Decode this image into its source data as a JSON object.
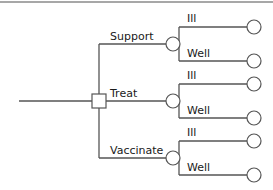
{
  "diagram": {
    "type": "decision-tree",
    "colors": {
      "line": "#555555",
      "rule": "#8a8a8a",
      "text": "#1a1a1a",
      "background": "#ffffff"
    },
    "root": {
      "node_type": "decision",
      "shape": "square"
    },
    "options": [
      {
        "label": "Support",
        "node_type": "chance",
        "outcomes": [
          {
            "label": "Ill",
            "node_type": "terminal"
          },
          {
            "label": "Well",
            "node_type": "terminal"
          }
        ]
      },
      {
        "label": "Treat",
        "node_type": "chance",
        "outcomes": [
          {
            "label": "Ill",
            "node_type": "terminal"
          },
          {
            "label": "Well",
            "node_type": "terminal"
          }
        ]
      },
      {
        "label": "Vaccinate",
        "node_type": "chance",
        "outcomes": [
          {
            "label": "Ill",
            "node_type": "terminal"
          },
          {
            "label": "Well",
            "node_type": "terminal"
          }
        ]
      }
    ]
  }
}
